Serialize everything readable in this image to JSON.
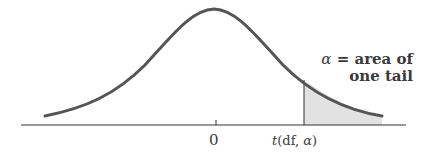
{
  "diagram": {
    "annotation_line1_symbol": "α",
    "annotation_line1_text": " = area of",
    "annotation_line2_text": "one tail",
    "x_tick_zero": "0",
    "critical_value_func": "t",
    "critical_value_args_open": "(df, ",
    "critical_value_alpha": "α",
    "critical_value_args_close": ")",
    "colors": {
      "curve": "#555555",
      "axis": "#333333",
      "shaded_tail": "#e2e2e2",
      "text": "#3a3a3a"
    }
  }
}
